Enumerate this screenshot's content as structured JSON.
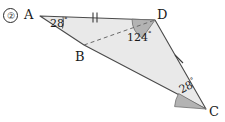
{
  "figure": {
    "item_number": "②",
    "type": "geometry-diagram",
    "shape": "quadrilateral",
    "fill_color": "#e9e9e9",
    "stroke_color": "#4a4a4a",
    "wedge_color": "#b3b3b3",
    "dash_color": "#6a6a6a",
    "vertices": [
      {
        "name": "A",
        "label": "A",
        "x": 40,
        "y": 16
      },
      {
        "name": "D",
        "label": "D",
        "x": 155,
        "y": 20
      },
      {
        "name": "C",
        "label": "C",
        "x": 206,
        "y": 109
      },
      {
        "name": "B",
        "label": "B",
        "x": 84,
        "y": 45
      }
    ],
    "angles": [
      {
        "at": "A",
        "value": "28",
        "degree_symbol": "°"
      },
      {
        "at": "D",
        "value": "124",
        "degree_symbol": "°"
      },
      {
        "at": "C",
        "value": "28",
        "degree_symbol": "°"
      }
    ],
    "tick_marks": [
      {
        "segment": "AD",
        "count": 2
      },
      {
        "segment": "DC",
        "count": 1
      }
    ],
    "dashed_segment": {
      "from": "B",
      "to": "D"
    }
  }
}
